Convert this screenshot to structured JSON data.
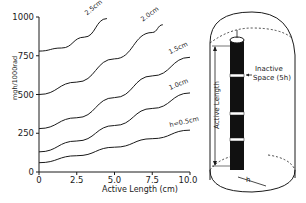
{
  "chart_data": {
    "type": "line",
    "title": "",
    "xlabel": "Active Length (cm)",
    "ylabel": "mgh/1000rad",
    "xlim": [
      0,
      10
    ],
    "ylim": [
      0,
      1000
    ],
    "x_ticks": [
      "0",
      "2.5",
      "5.0",
      "7.5",
      "10.0"
    ],
    "y_ticks": [
      "0",
      "250",
      "500",
      "750",
      "1000"
    ],
    "grid": false,
    "legend": "inline curve labels",
    "series": [
      {
        "name": "h=0.5cm",
        "label": "h=0.5cm",
        "x": [
          0,
          2.5,
          5,
          7.5,
          10
        ],
        "values": [
          60,
          105,
          160,
          215,
          270
        ]
      },
      {
        "name": "1.0cm",
        "label": "1.0cm",
        "x": [
          0,
          2.5,
          5,
          7.5,
          10
        ],
        "values": [
          130,
          200,
          300,
          410,
          510
        ]
      },
      {
        "name": "1.5cm",
        "label": "1.5cm",
        "x": [
          0,
          2.5,
          5,
          7.5,
          10
        ],
        "values": [
          280,
          350,
          480,
          620,
          740
        ]
      },
      {
        "name": "2.0cm",
        "label": "2.0cm",
        "x": [
          0,
          2.5,
          5,
          7.5,
          8.2
        ],
        "values": [
          500,
          580,
          730,
          900,
          950
        ]
      },
      {
        "name": "2.5cm",
        "label": "2.5cm",
        "x": [
          0,
          1.5,
          3,
          4.5
        ],
        "values": [
          780,
          800,
          870,
          990
        ]
      }
    ]
  },
  "diagram": {
    "label_active_length": "Active Length",
    "label_inactive": "Inactive",
    "label_space": "Space (5h)",
    "label_h": "h"
  }
}
